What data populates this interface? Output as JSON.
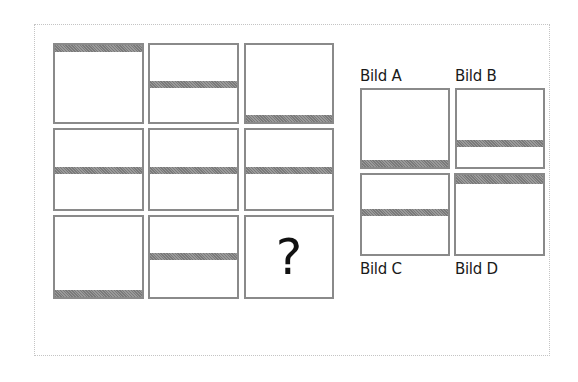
{
  "puzzle": {
    "matrix": [
      {
        "row": 1,
        "col": 1,
        "stripe": "top"
      },
      {
        "row": 1,
        "col": 2,
        "stripe": "upper-middle"
      },
      {
        "row": 1,
        "col": 3,
        "stripe": "bottom"
      },
      {
        "row": 2,
        "col": 1,
        "stripe": "middle"
      },
      {
        "row": 2,
        "col": 2,
        "stripe": "middle"
      },
      {
        "row": 2,
        "col": 3,
        "stripe": "middle"
      },
      {
        "row": 3,
        "col": 1,
        "stripe": "bottom"
      },
      {
        "row": 3,
        "col": 2,
        "stripe": "upper-middle"
      },
      {
        "row": 3,
        "col": 3,
        "stripe": "none",
        "text": "?"
      }
    ],
    "question_mark": "?",
    "options": [
      {
        "label": "Bild A",
        "stripe": "bottom"
      },
      {
        "label": "Bild B",
        "stripe": "lower-middle"
      },
      {
        "label": "Bild C",
        "stripe": "upper-middle"
      },
      {
        "label": "Bild D",
        "stripe": "top"
      }
    ]
  },
  "colors": {
    "cell_border": "#8a8a8a",
    "stripe": "#8a8a8a",
    "frame_border": "#c4c4c4",
    "text": "#1a1a1a"
  }
}
